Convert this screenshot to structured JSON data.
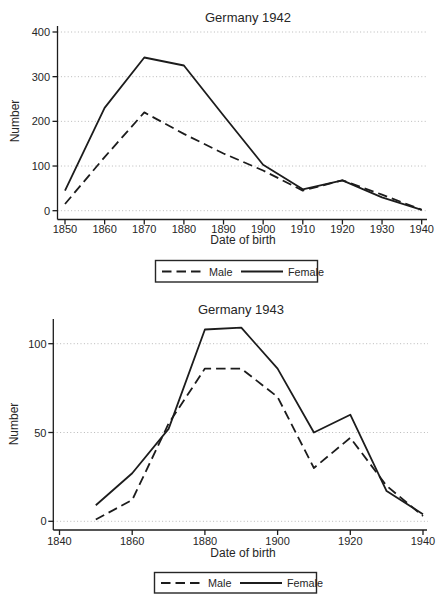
{
  "figure": {
    "background": "#ffffff",
    "line_color": "#1c1c1c",
    "grid_color": "#b9b9b9",
    "text_color": "#262626"
  },
  "chart_data": [
    {
      "type": "line",
      "title": "Germany 1942",
      "xlabel": "Date of birth",
      "ylabel": "Number",
      "x": [
        1850,
        1860,
        1870,
        1880,
        1890,
        1900,
        1910,
        1920,
        1930,
        1940
      ],
      "series": [
        {
          "name": "Female",
          "style": "solid",
          "values": [
            45,
            230,
            343,
            325,
            213,
            103,
            48,
            68,
            30,
            2
          ]
        },
        {
          "name": "Male",
          "style": "dashed",
          "values": [
            15,
            120,
            220,
            172,
            128,
            90,
            45,
            68,
            36,
            2
          ]
        }
      ],
      "ylim": [
        0,
        400
      ],
      "yticks": [
        0,
        100,
        200,
        300,
        400
      ],
      "xticks": [
        1850,
        1860,
        1870,
        1880,
        1890,
        1900,
        1910,
        1920,
        1930,
        1940
      ],
      "grid": "horizontal-dotted",
      "legend_position": "bottom-center",
      "legend_entries": [
        "Male",
        "Female"
      ]
    },
    {
      "type": "line",
      "title": "Germany 1943",
      "xlabel": "Date of birth",
      "ylabel": "Number",
      "x": [
        1850,
        1860,
        1870,
        1880,
        1890,
        1900,
        1910,
        1920,
        1930,
        1940
      ],
      "series": [
        {
          "name": "Female",
          "style": "solid",
          "values": [
            9,
            27,
            52,
            108,
            109,
            86,
            50,
            60,
            17,
            4
          ]
        },
        {
          "name": "Male",
          "style": "dashed",
          "values": [
            1,
            12,
            55,
            86,
            86,
            70,
            30,
            47,
            20,
            3
          ]
        }
      ],
      "ylim": [
        0,
        113
      ],
      "yticks": [
        0,
        50,
        100
      ],
      "xticks": [
        1840,
        1860,
        1880,
        1900,
        1920,
        1940
      ],
      "grid": "horizontal-dotted",
      "legend_position": "bottom-center",
      "legend_entries": [
        "Male",
        "Female"
      ]
    }
  ]
}
